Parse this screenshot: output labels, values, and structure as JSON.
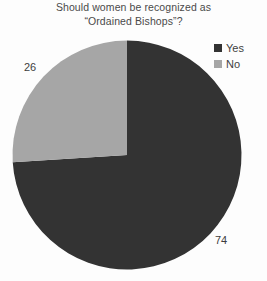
{
  "chart_data": {
    "type": "pie",
    "title": "Should women be recognized as “Ordained Bishops”?",
    "title_lines": [
      "Should women be recognized as",
      "“Ordained Bishops”?"
    ],
    "categories": [
      "Yes",
      "No"
    ],
    "values": [
      74,
      26
    ],
    "labels": [
      "74",
      "26"
    ],
    "colors": [
      "#333333",
      "#a6a6a6"
    ],
    "legend": {
      "position": "top-right",
      "entries": [
        {
          "label": "Yes",
          "color": "#333333"
        },
        {
          "label": "No",
          "color": "#a6a6a6"
        }
      ]
    },
    "start_angle_deg": 0,
    "direction": "clockwise",
    "grid": false,
    "xlabel": "",
    "ylabel": "",
    "background": "#fdfdfd"
  }
}
